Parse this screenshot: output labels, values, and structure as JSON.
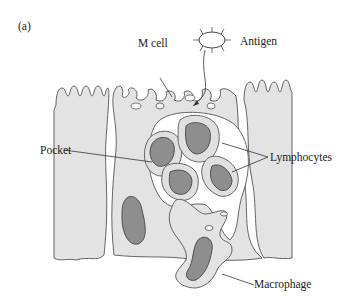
{
  "figure": {
    "panel_label": "(a)",
    "labels": {
      "m_cell": "M cell",
      "antigen": "Antigen",
      "pocket": "Pocket",
      "lymphocytes": "Lymphocytes",
      "macrophage": "Macrophage"
    },
    "colors": {
      "cytoplasm": "#e3e3e3",
      "nucleus": "#8e8e8e",
      "outline": "#555555",
      "background": "#ffffff"
    }
  }
}
